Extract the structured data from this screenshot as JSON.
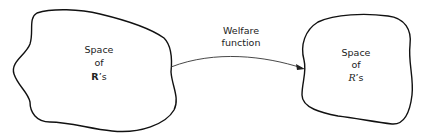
{
  "diagram": {
    "left_region": {
      "line1": "Space",
      "line2": "of",
      "line3_symbol": "R",
      "line3_suffix": "’s",
      "symbol_style": "bold"
    },
    "right_region": {
      "line1": "Space",
      "line2": "of",
      "line3_symbol": "R",
      "line3_suffix": "’s",
      "symbol_style": "italic"
    },
    "arrow": {
      "label_line1": "Welfare",
      "label_line2": "function",
      "direction": "left-to-right"
    },
    "colors": {
      "stroke": "#111111",
      "text": "#222222",
      "background": "#ffffff"
    }
  }
}
